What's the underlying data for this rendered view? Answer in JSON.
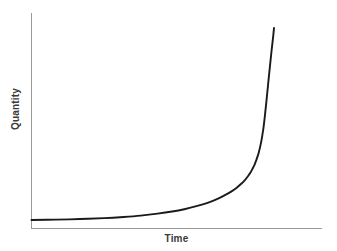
{
  "chart_data": {
    "type": "line",
    "title": "",
    "subtitle": "",
    "xlabel": "Time",
    "ylabel": "Quantity",
    "curve_label": "exponential growth",
    "grid": false,
    "legend": false,
    "legend_position": "none",
    "xlim": [
      0,
      1
    ],
    "ylim": [
      0,
      1
    ],
    "xticks": [],
    "yticks": [],
    "xticklabels": [],
    "yticklabels": [],
    "annotations": [],
    "series": [
      {
        "name": "exponential growth",
        "color": "#1a1a1a",
        "x": [
          0.0,
          0.1,
          0.2,
          0.3,
          0.38,
          0.45,
          0.52,
          0.58,
          0.63,
          0.68,
          0.72,
          0.76,
          0.79,
          0.82,
          0.845,
          0.865,
          0.88,
          0.893,
          0.903,
          0.912,
          0.92,
          0.927,
          0.933,
          0.938,
          0.943,
          0.948,
          0.952,
          0.957,
          0.962,
          0.968,
          0.975,
          0.983,
          0.99,
          0.997,
          1.0
        ],
        "y": [
          0.0,
          0.002,
          0.005,
          0.01,
          0.016,
          0.023,
          0.033,
          0.044,
          0.056,
          0.072,
          0.087,
          0.106,
          0.124,
          0.145,
          0.167,
          0.189,
          0.208,
          0.229,
          0.247,
          0.268,
          0.289,
          0.312,
          0.334,
          0.356,
          0.382,
          0.412,
          0.442,
          0.484,
          0.537,
          0.609,
          0.698,
          0.798,
          0.882,
          0.96,
          1.0
        ]
      }
    ]
  },
  "axes": {
    "x_axis_name": "horizontal-axis",
    "y_axis_name": "vertical-axis",
    "axis_color": "#9a9a9a"
  },
  "canvas": {
    "background": "#ffffff",
    "width": 337,
    "height": 251
  }
}
